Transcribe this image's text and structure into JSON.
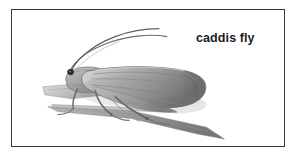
{
  "figure": {
    "caption": "caddis fly",
    "subject": "caddis fly",
    "medium": "pencil-drawing",
    "frame_color": "#3a3a3c",
    "background_color": "#ffffff",
    "ink_color": "#6f6f70",
    "text_color": "#1d1d1f",
    "elements": {
      "antennae_label": "antennae",
      "head_label": "head",
      "eye_label": "eye",
      "wing_label": "folded-wing",
      "legs_label": "legs",
      "perch_label": "grass-blade"
    }
  }
}
